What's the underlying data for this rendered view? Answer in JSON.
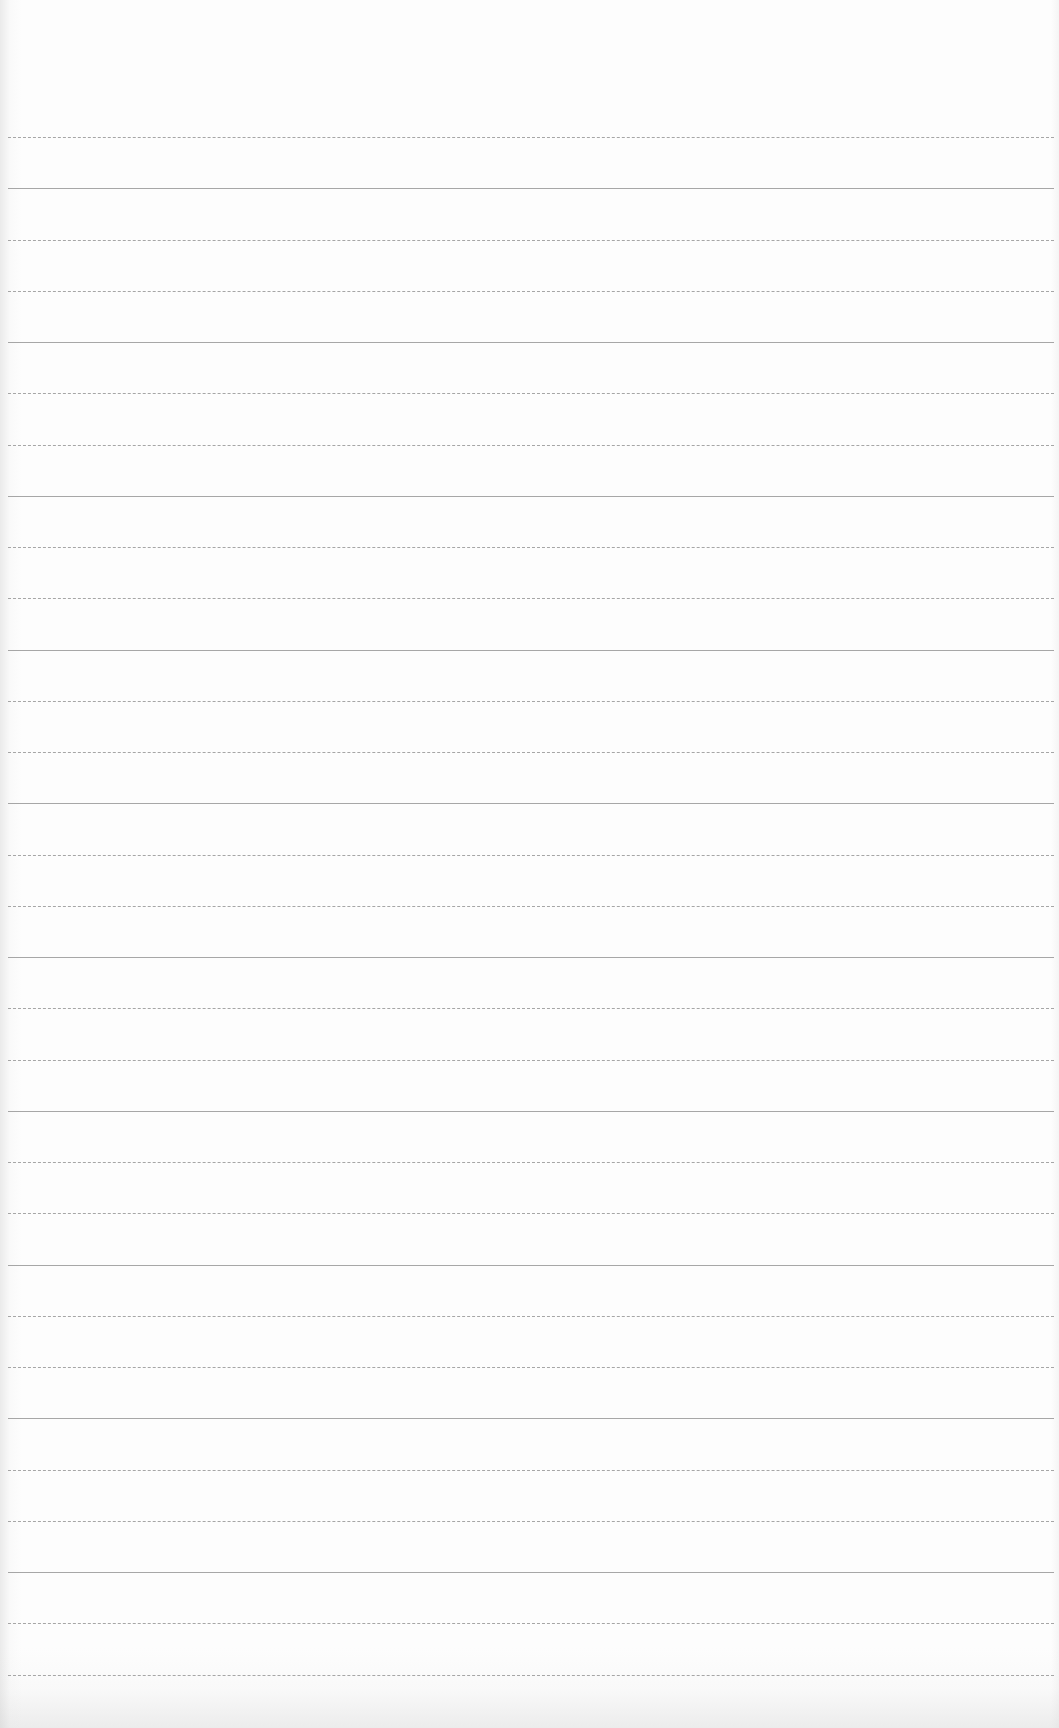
{
  "document": {
    "type": "ruled-paper",
    "text_content": "",
    "background_color": "#fdfdfd",
    "line_color": "#8a8a8a",
    "rules": {
      "count": 31,
      "first_y": 137,
      "spacing": 51.25,
      "left": 8,
      "right_margin": 5
    }
  }
}
